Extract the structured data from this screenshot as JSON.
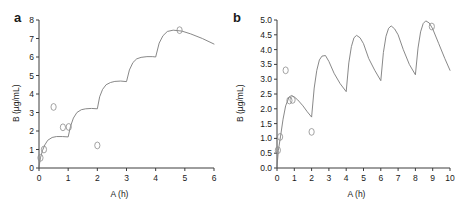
{
  "figure": {
    "background": "#ffffff",
    "line_color": "#7a7a7a",
    "axis_color": "#3c3c3c",
    "text_color": "#1a1a1a",
    "marker_color": "#8c8c8c"
  },
  "panels": [
    {
      "letter": "a",
      "xlabel": "A (h)",
      "ylabel": "B (µg/mL)",
      "xticks": [
        "0",
        "1",
        "2",
        "3",
        "4",
        "5",
        "6"
      ],
      "yticks": [
        "0",
        "1",
        "2",
        "3",
        "4",
        "5",
        "6",
        "7",
        "8"
      ]
    },
    {
      "letter": "b",
      "xlabel": "A (h)",
      "ylabel": "B (µg/mL)",
      "xticks": [
        "0",
        "1",
        "2",
        "3",
        "4",
        "5",
        "6",
        "7",
        "8",
        "9",
        "10"
      ],
      "yticks": [
        "0.0",
        "0.5",
        "1.0",
        "1.5",
        "2.0",
        "2.5",
        "3.0",
        "3.5",
        "4.0",
        "4.5",
        "5.0"
      ]
    }
  ],
  "chart_data": [
    {
      "type": "line",
      "panel": "a",
      "title": "",
      "xlabel": "A (h)",
      "ylabel": "B (µg/mL)",
      "xlim": [
        0,
        6
      ],
      "ylim": [
        0,
        8
      ],
      "xticks": [
        0,
        1,
        2,
        3,
        4,
        5,
        6
      ],
      "yticks": [
        0,
        1,
        2,
        3,
        4,
        5,
        6,
        7,
        8
      ],
      "grid": false,
      "legend": null,
      "description": "Accumulating staircase concentration profile with repeated dosing at 0, 1, 2, 3 and 4 h",
      "series": [
        {
          "name": "concentration",
          "x": [
            0.0,
            0.05,
            0.12,
            0.2,
            0.3,
            0.45,
            0.6,
            0.8,
            1.0,
            1.0,
            1.08,
            1.18,
            1.3,
            1.45,
            1.6,
            1.8,
            2.0,
            2.0,
            2.08,
            2.18,
            2.3,
            2.45,
            2.6,
            2.8,
            3.0,
            3.0,
            3.1,
            3.22,
            3.35,
            3.5,
            3.7,
            3.9,
            4.0,
            4.0,
            4.12,
            4.25,
            4.4,
            4.6,
            4.9,
            5.2,
            5.6,
            6.0
          ],
          "y": [
            0.05,
            0.55,
            0.95,
            1.25,
            1.5,
            1.65,
            1.7,
            1.7,
            1.68,
            1.68,
            2.25,
            2.7,
            3.0,
            3.15,
            3.2,
            3.22,
            3.2,
            3.2,
            3.85,
            4.25,
            4.5,
            4.62,
            4.68,
            4.7,
            4.67,
            4.67,
            5.3,
            5.7,
            5.9,
            5.98,
            6.02,
            6.02,
            6.0,
            6.0,
            6.75,
            7.15,
            7.38,
            7.45,
            7.4,
            7.25,
            7.0,
            6.7
          ]
        }
      ],
      "markers": [
        {
          "x": 0.05,
          "y": 0.55
        },
        {
          "x": 0.17,
          "y": 1.0
        },
        {
          "x": 0.5,
          "y": 3.3
        },
        {
          "x": 0.82,
          "y": 2.2
        },
        {
          "x": 1.02,
          "y": 2.22
        },
        {
          "x": 2.0,
          "y": 1.22
        },
        {
          "x": 4.82,
          "y": 7.45
        }
      ]
    },
    {
      "type": "line",
      "panel": "b",
      "title": "",
      "xlabel": "A (h)",
      "ylabel": "B (µg/mL)",
      "xlim": [
        0,
        10
      ],
      "ylim": [
        0,
        5
      ],
      "xticks": [
        0,
        1,
        2,
        3,
        4,
        5,
        6,
        7,
        8,
        9,
        10
      ],
      "yticks": [
        0.0,
        0.5,
        1.0,
        1.5,
        2.0,
        2.5,
        3.0,
        3.5,
        4.0,
        4.5,
        5.0
      ],
      "grid": false,
      "legend": null,
      "description": "Sawtooth multiple-dose profile with doses at 0, 2, 4, 6 and 8 h; peaks and troughs rise toward steady state",
      "series": [
        {
          "name": "concentration",
          "x": [
            0.0,
            0.08,
            0.2,
            0.35,
            0.5,
            0.7,
            0.85,
            1.0,
            1.2,
            1.5,
            1.75,
            2.0,
            2.0,
            2.15,
            2.3,
            2.45,
            2.6,
            2.8,
            3.0,
            3.3,
            3.65,
            4.0,
            4.0,
            4.15,
            4.3,
            4.45,
            4.6,
            4.8,
            5.0,
            5.3,
            5.65,
            6.0,
            6.0,
            6.15,
            6.3,
            6.45,
            6.6,
            6.8,
            7.0,
            7.3,
            7.65,
            8.0,
            8.0,
            8.15,
            8.3,
            8.45,
            8.6,
            8.8,
            9.0,
            9.35,
            9.7,
            10.0
          ],
          "y": [
            0.05,
            0.6,
            1.05,
            1.65,
            2.1,
            2.4,
            2.45,
            2.4,
            2.3,
            2.1,
            1.9,
            1.72,
            1.72,
            2.7,
            3.3,
            3.65,
            3.78,
            3.8,
            3.6,
            3.2,
            2.85,
            2.58,
            2.58,
            3.55,
            4.1,
            4.4,
            4.48,
            4.4,
            4.2,
            3.7,
            3.3,
            2.95,
            2.95,
            3.9,
            4.45,
            4.72,
            4.8,
            4.7,
            4.5,
            4.0,
            3.5,
            3.15,
            3.15,
            4.05,
            4.6,
            4.88,
            4.97,
            4.9,
            4.7,
            4.2,
            3.7,
            3.3
          ]
        }
      ],
      "markers": [
        {
          "x": 0.05,
          "y": 0.6
        },
        {
          "x": 0.18,
          "y": 1.05
        },
        {
          "x": 0.5,
          "y": 3.3
        },
        {
          "x": 0.72,
          "y": 2.28
        },
        {
          "x": 0.9,
          "y": 2.3
        },
        {
          "x": 2.0,
          "y": 1.22
        },
        {
          "x": 8.95,
          "y": 4.78
        }
      ]
    }
  ]
}
